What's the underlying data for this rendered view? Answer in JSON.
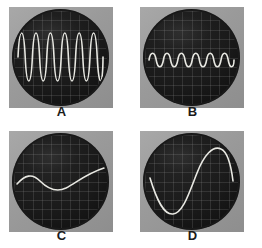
{
  "figure": {
    "background_color": "#ffffff",
    "layout": "2x2-grid",
    "panel_count": 4
  },
  "colors": {
    "frame": "#9b9b9b",
    "bezel": "#2b2b2b",
    "screen": "#171717",
    "graticule": "#969696",
    "trace": "#e8e8e2",
    "label": "#1b1b1b"
  },
  "panels": [
    {
      "label": "A",
      "name": "oscilloscope-a",
      "description": "high-frequency large-amplitude sine wave",
      "cycles": 6,
      "amplitude": "large"
    },
    {
      "label": "B",
      "name": "oscilloscope-b",
      "description": "high-frequency small-amplitude sine wave",
      "cycles": 6,
      "amplitude": "small"
    },
    {
      "label": "C",
      "name": "oscilloscope-c",
      "description": "low-frequency small-amplitude sine wave",
      "cycles": 1,
      "amplitude": "small"
    },
    {
      "label": "D",
      "name": "oscilloscope-d",
      "description": "low-frequency large-amplitude sine wave",
      "cycles": 1,
      "amplitude": "large"
    }
  ],
  "chart_data": {
    "type": "line",
    "title": "",
    "xlabel": "",
    "ylabel": "",
    "note": "Four CRT oscilloscope traces of sine waves varying in frequency and amplitude",
    "series": [
      {
        "name": "A",
        "cycles": 6,
        "amplitude_fraction": 0.82,
        "phase": "sine",
        "path": "M 4 46 C 5.5 14, 9.7 14, 11.2 46 C 12.7 78, 16.9 78, 18.4 46 C 19.9 14, 24.1 14, 25.6 46 C 27.1 78, 31.3 78, 32.8 46 C 34.3 14, 38.5 14, 40 46 C 41.5 78, 45.7 78, 47.2 46 C 48.7 14, 52.9 14, 54.4 46 C 55.9 78, 60.1 78, 61.6 46 C 63.1 14, 67.3 14, 68.8 46 C 70.3 78, 74.5 78, 76 46 C 77.5 14, 81.7 14, 83.2 46 C 84.7 78, 88.9 78, 89 46"
      },
      {
        "name": "B",
        "cycles": 6,
        "amplitude_fraction": 0.22,
        "phase": "sine",
        "path": "M 4 49 C 5.5 40, 9.7 40, 11.2 49 C 12.7 58, 16.9 58, 18.4 49 C 19.9 40, 24.1 40, 25.6 49 C 27.1 58, 31.3 58, 32.8 49 C 34.3 40, 38.5 40, 40 49 C 41.5 58, 45.7 58, 47.2 49 C 48.7 40, 52.9 40, 54.4 49 C 55.9 58, 60.1 58, 61.6 49 C 63.1 40, 67.3 40, 68.8 49 C 70.3 58, 74.5 58, 76 49 C 77.5 40, 81.7 40, 83.2 49 C 84.7 58, 88.9 58, 89 49"
      },
      {
        "name": "C",
        "cycles": 1,
        "amplitude_fraction": 0.2,
        "phase": "sine-inverted-start",
        "path": "M 3 49 C 11 40, 18 38, 26 46 C 34 54, 42 58, 52 53 C 63 47, 74 38, 90 33"
      },
      {
        "name": "D",
        "cycles": 1,
        "amplitude_fraction": 0.8,
        "phase": "sine-inverted-start",
        "path": "M 5 43 C 12 66, 19 80, 28 79 C 38 78, 44 58, 52 38 C 59 20, 68 10, 76 14 C 83 17, 86 30, 88 46"
      }
    ]
  }
}
